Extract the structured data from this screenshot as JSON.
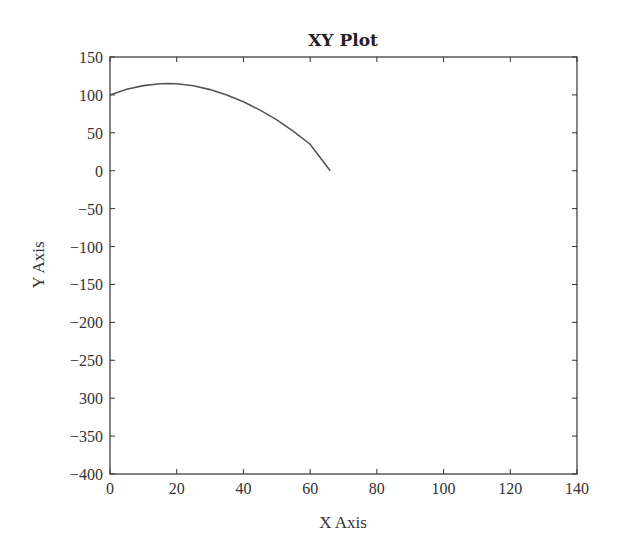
{
  "chart_data": {
    "type": "line",
    "title": "XY Plot",
    "xlabel": "X Axis",
    "ylabel": "Y Axis",
    "xlim": [
      0,
      140
    ],
    "ylim": [
      -400,
      150
    ],
    "xticks": [
      "0",
      "20",
      "40",
      "60",
      "80",
      "100",
      "120",
      "140"
    ],
    "yticks": [
      "150",
      "100",
      "50",
      "0",
      "−50",
      "−100",
      "−150",
      "−200",
      "−250",
      "300",
      "−350",
      "−400"
    ],
    "grid": false,
    "legend": null,
    "series": [
      {
        "name": "trajectory",
        "color": "#555555",
        "x": [
          0,
          5,
          10,
          15,
          17.3,
          20,
          25,
          30,
          35,
          40,
          45,
          50,
          55,
          60,
          66
        ],
        "y": [
          100,
          107.4,
          112.3,
          114.7,
          115,
          114.6,
          112,
          107,
          100,
          91,
          80,
          67,
          52,
          35,
          0
        ]
      }
    ]
  },
  "colors": {
    "axis": "#333333",
    "line": "#555555",
    "background": "#ffffff"
  }
}
